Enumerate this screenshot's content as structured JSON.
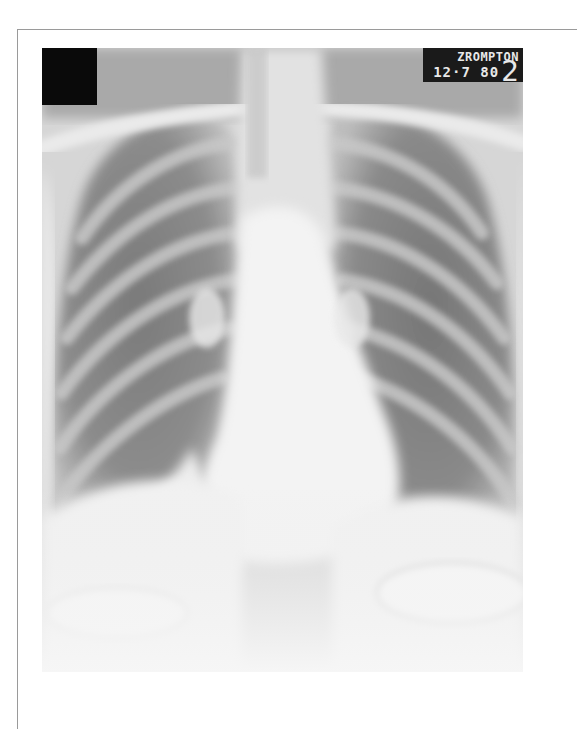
{
  "image": {
    "subject": "chest-x-ray-pa-view",
    "marker": {
      "line1": "ZROMPTON",
      "line2": "12·7 80",
      "side_digit": "2"
    }
  },
  "colors": {
    "background": "#ffffff",
    "frame_border": "#9a9a9a",
    "lung_dark": "#6e6e6e",
    "bone_light": "#f4f4f4",
    "marker_bg": "#1a1a1a"
  }
}
